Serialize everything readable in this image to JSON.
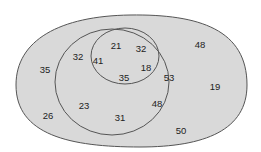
{
  "diagram": {
    "type": "venn-nested",
    "colors": {
      "fill": "#d9d9d9",
      "stroke": "#555555",
      "text": "#222222",
      "background": "#ffffff"
    },
    "labels": [
      {
        "value": "21",
        "x": 116,
        "y": 49
      },
      {
        "value": "32",
        "x": 141,
        "y": 52
      },
      {
        "value": "41",
        "x": 98,
        "y": 64
      },
      {
        "value": "18",
        "x": 146,
        "y": 71
      },
      {
        "value": "35",
        "x": 124,
        "y": 81
      },
      {
        "value": "32",
        "x": 78,
        "y": 60
      },
      {
        "value": "53",
        "x": 169,
        "y": 81
      },
      {
        "value": "23",
        "x": 84,
        "y": 109
      },
      {
        "value": "48",
        "x": 157,
        "y": 107
      },
      {
        "value": "31",
        "x": 120,
        "y": 121
      },
      {
        "value": "48",
        "x": 200,
        "y": 48
      },
      {
        "value": "35",
        "x": 45,
        "y": 73
      },
      {
        "value": "19",
        "x": 215,
        "y": 90
      },
      {
        "value": "26",
        "x": 48,
        "y": 119
      },
      {
        "value": "50",
        "x": 181,
        "y": 134
      }
    ]
  }
}
